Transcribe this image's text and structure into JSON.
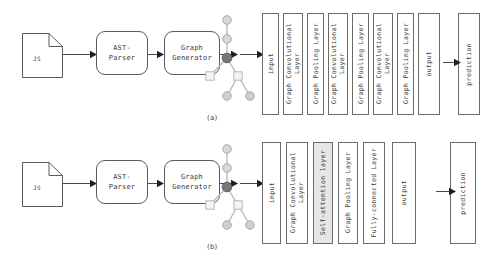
{
  "figure": {
    "rows": [
      {
        "caption": "(a)",
        "pipeline": {
          "source_file": {
            "icon": "document-icon",
            "label": "JS"
          },
          "parser": {
            "label": "AST-\nParser"
          },
          "generator": {
            "label": "Graph\nGenerator"
          },
          "graph": {
            "icon": "ast-graph-icon",
            "nodes": [
              {
                "id": "n0",
                "shape": "circle",
                "fill": "#d8d8d8",
                "x": 29,
                "y": 8
              },
              {
                "id": "n1",
                "shape": "circle",
                "fill": "#d8d8d8",
                "x": 29,
                "y": 27
              },
              {
                "id": "n2",
                "shape": "circle",
                "fill": "#777777",
                "x": 29,
                "y": 46
              },
              {
                "id": "n3",
                "shape": "square",
                "fill": "#f0f0f0",
                "x": 12,
                "y": 64
              },
              {
                "id": "n4",
                "shape": "square",
                "fill": "#f0f0f0",
                "x": 40,
                "y": 64
              },
              {
                "id": "n5",
                "shape": "circle",
                "fill": "#cfcfcf",
                "x": 29,
                "y": 84
              },
              {
                "id": "n6",
                "shape": "circle",
                "fill": "#cfcfcf",
                "x": 52,
                "y": 84
              }
            ],
            "edges": [
              [
                "n0",
                "n1"
              ],
              [
                "n1",
                "n2"
              ],
              [
                "n2",
                "n3"
              ],
              [
                "n2",
                "n4"
              ],
              [
                "n4",
                "n5"
              ],
              [
                "n4",
                "n6"
              ]
            ]
          }
        },
        "layers": [
          {
            "label": "input",
            "shaded": false
          },
          {
            "label": "Graph Convolutional\nLayer",
            "shaded": false
          },
          {
            "label": "Graph Pooling Layer",
            "shaded": false
          },
          {
            "label": "Graph Convolutional\nLayer",
            "shaded": false
          },
          {
            "label": "Graph Pooling Layer",
            "shaded": false
          },
          {
            "label": "Graph Convolutional\nLayer",
            "shaded": false
          },
          {
            "label": "Graph Pooling Layer",
            "shaded": false
          },
          {
            "label": "output",
            "shaded": false
          },
          {
            "label": "prediction",
            "shaded": false
          }
        ]
      },
      {
        "caption": "(b)",
        "pipeline": {
          "source_file": {
            "icon": "document-icon",
            "label": "JS"
          },
          "parser": {
            "label": "AST-\nParser"
          },
          "generator": {
            "label": "Graph\nGenerator"
          },
          "graph": {
            "icon": "ast-graph-icon",
            "nodes": [
              {
                "id": "n0",
                "shape": "circle",
                "fill": "#d8d8d8",
                "x": 29,
                "y": 8
              },
              {
                "id": "n1",
                "shape": "circle",
                "fill": "#d8d8d8",
                "x": 29,
                "y": 27
              },
              {
                "id": "n2",
                "shape": "circle",
                "fill": "#777777",
                "x": 29,
                "y": 46
              },
              {
                "id": "n3",
                "shape": "square",
                "fill": "#f0f0f0",
                "x": 12,
                "y": 64
              },
              {
                "id": "n4",
                "shape": "square",
                "fill": "#f0f0f0",
                "x": 40,
                "y": 64
              },
              {
                "id": "n5",
                "shape": "circle",
                "fill": "#cfcfcf",
                "x": 29,
                "y": 84
              },
              {
                "id": "n6",
                "shape": "circle",
                "fill": "#cfcfcf",
                "x": 52,
                "y": 84
              }
            ],
            "edges": [
              [
                "n0",
                "n1"
              ],
              [
                "n1",
                "n2"
              ],
              [
                "n2",
                "n3"
              ],
              [
                "n2",
                "n4"
              ],
              [
                "n4",
                "n5"
              ],
              [
                "n4",
                "n6"
              ]
            ]
          }
        },
        "layers": [
          {
            "label": "input",
            "shaded": false
          },
          {
            "label": "Graph Convolutional\nLayer",
            "shaded": false
          },
          {
            "label": "Self-attention layer",
            "shaded": true
          },
          {
            "label": "Graph Pooling Layer",
            "shaded": false
          },
          {
            "label": "Fully-connected Layer",
            "shaded": false
          },
          {
            "label": "output",
            "shaded": false
          },
          {
            "label": "prediction",
            "shaded": false
          }
        ]
      }
    ]
  },
  "colors": {
    "stroke": "#5b5b5b",
    "layer_stroke": "#6a6a6a",
    "shaded_fill": "#e6e6e6",
    "root_node": "#777777",
    "node_light": "#d8d8d8",
    "square_node": "#f0f0f0",
    "text": "#3a3a3a",
    "background": "#ffffff"
  }
}
